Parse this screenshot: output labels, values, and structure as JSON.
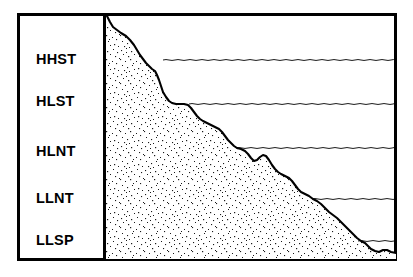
{
  "figure": {
    "background_color": "#ffffff",
    "line_color": "#000000",
    "fill_pattern": "stipple",
    "frame": {
      "x": 17,
      "y": 13,
      "width": 380,
      "height": 248,
      "stroke_width": 3
    },
    "divider": {
      "x": 104,
      "stroke_width": 3
    }
  },
  "legend_panel": {
    "name": "systems-tract-legend",
    "items": [
      {
        "id": "hhst",
        "label": "HHST",
        "y": 59
      },
      {
        "id": "hlst",
        "label": "HLST",
        "y": 101
      },
      {
        "id": "hlnt",
        "label": "HLNT",
        "y": 151
      },
      {
        "id": "llnt",
        "label": "LLNT",
        "y": 198
      },
      {
        "id": "llsp",
        "label": "LLSP",
        "y": 240
      }
    ]
  },
  "surfaces": {
    "name": "wavy-surface-lines",
    "lines": [
      {
        "id": "hhst-surface",
        "tract": "HHST",
        "y": 60,
        "x_start": 163,
        "x_end": 396
      },
      {
        "id": "hlst-surface",
        "tract": "HLST",
        "y": 104,
        "x_start": 189,
        "x_end": 396
      },
      {
        "id": "hlnt-surface",
        "tract": "HLNT",
        "y": 148,
        "x_start": 236,
        "x_end": 396
      },
      {
        "id": "llnt-surface",
        "tract": "LLNT",
        "y": 199,
        "x_start": 312,
        "x_end": 396
      },
      {
        "id": "llsp-surface",
        "tract": "LLSP",
        "y": 241,
        "x_start": 358,
        "x_end": 396
      }
    ]
  },
  "chart_data": {
    "type": "area",
    "xlabel": "",
    "ylabel": "",
    "grid": false,
    "legend_position": "left-panel",
    "categories": [
      "HHST",
      "HLST",
      "HLNT",
      "LLNT",
      "LLSP"
    ],
    "series": [
      {
        "name": "sediment-surface-profile",
        "points": [
          [
            107,
            16
          ],
          [
            110,
            22
          ],
          [
            113,
            27
          ],
          [
            117,
            30
          ],
          [
            121,
            33
          ],
          [
            126,
            36
          ],
          [
            130,
            40
          ],
          [
            134,
            45
          ],
          [
            137,
            50
          ],
          [
            140,
            55
          ],
          [
            143,
            59
          ],
          [
            146,
            63
          ],
          [
            149,
            66
          ],
          [
            152,
            69
          ],
          [
            155,
            71
          ],
          [
            157,
            75
          ],
          [
            159,
            80
          ],
          [
            161,
            86
          ],
          [
            163,
            92
          ],
          [
            166,
            97
          ],
          [
            169,
            101
          ],
          [
            172,
            103
          ],
          [
            176,
            104
          ],
          [
            180,
            104
          ],
          [
            184,
            104
          ],
          [
            188,
            105
          ],
          [
            191,
            108
          ],
          [
            194,
            112
          ],
          [
            197,
            116
          ],
          [
            200,
            119
          ],
          [
            203,
            121
          ],
          [
            207,
            123
          ],
          [
            211,
            125
          ],
          [
            215,
            127
          ],
          [
            219,
            129
          ],
          [
            222,
            132
          ],
          [
            225,
            136
          ],
          [
            228,
            140
          ],
          [
            231,
            143
          ],
          [
            234,
            146
          ],
          [
            237,
            148
          ],
          [
            241,
            149
          ],
          [
            245,
            151
          ],
          [
            248,
            154
          ],
          [
            251,
            158
          ],
          [
            254,
            161
          ],
          [
            257,
            160
          ],
          [
            260,
            157
          ],
          [
            263,
            155
          ],
          [
            266,
            156
          ],
          [
            269,
            160
          ],
          [
            272,
            165
          ],
          [
            275,
            169
          ],
          [
            278,
            172
          ],
          [
            281,
            174
          ],
          [
            285,
            176
          ],
          [
            289,
            178
          ],
          [
            292,
            181
          ],
          [
            295,
            185
          ],
          [
            298,
            189
          ],
          [
            301,
            192
          ],
          [
            305,
            194
          ],
          [
            309,
            196
          ],
          [
            313,
            199
          ],
          [
            317,
            201
          ],
          [
            321,
            204
          ],
          [
            325,
            208
          ],
          [
            329,
            212
          ],
          [
            333,
            215
          ],
          [
            337,
            218
          ],
          [
            341,
            222
          ],
          [
            345,
            226
          ],
          [
            349,
            230
          ],
          [
            353,
            234
          ],
          [
            357,
            238
          ],
          [
            361,
            241
          ],
          [
            365,
            243
          ],
          [
            368,
            246
          ],
          [
            371,
            249
          ],
          [
            375,
            251
          ],
          [
            379,
            252
          ],
          [
            383,
            250
          ],
          [
            387,
            250
          ],
          [
            391,
            252
          ],
          [
            396,
            253
          ]
        ],
        "baseline_y": 259,
        "origin_x": 105
      }
    ]
  }
}
